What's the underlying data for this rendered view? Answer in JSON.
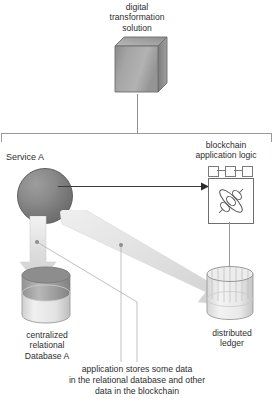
{
  "diagram": {
    "title_top": "digital\ntransformation\nsolution",
    "service_label": "Service A",
    "blockchain_label": "blockchain\napplication logic",
    "database_left_label": "centralized\nrelational\nDatabase A",
    "database_right_label": "distributed\nledger",
    "caption": "application stores some data\nin the relational database and other\ndata in the blockchain",
    "colors": {
      "cube_fill": "#a3a3a3",
      "sphere_fill": "#7a7a7a",
      "fat_arrow": "#dcdcdc",
      "line": "#9a9a9a",
      "text": "#2e2e2e"
    }
  }
}
